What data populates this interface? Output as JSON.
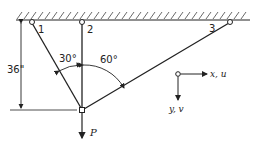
{
  "diagram": {
    "type": "three-bar truss with load P",
    "supports": [
      {
        "id": "1",
        "label": "1"
      },
      {
        "id": "2",
        "label": "2"
      },
      {
        "id": "3",
        "label": "3"
      }
    ],
    "dimension": {
      "label": "36\""
    },
    "angles": [
      {
        "label": "30°"
      },
      {
        "label": "60°"
      }
    ],
    "load": {
      "label": "P"
    },
    "axes": {
      "x_label": "x, u",
      "y_label": "y, v"
    },
    "colors": {
      "line": "#222222",
      "background": "#ffffff"
    }
  }
}
